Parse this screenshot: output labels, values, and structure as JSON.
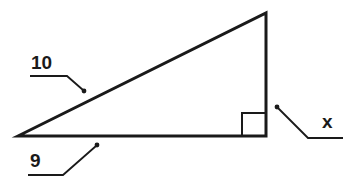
{
  "figure": {
    "type": "right-triangle",
    "labels": {
      "hypotenuse": "10",
      "base": "9",
      "vertical_leg": "x"
    },
    "colors": {
      "stroke": "#1a1a1a",
      "background": "#ffffff"
    }
  }
}
